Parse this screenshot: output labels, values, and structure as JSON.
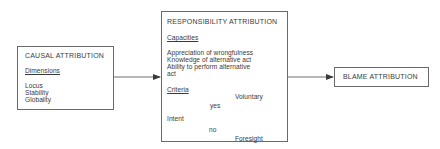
{
  "causal": {
    "title": "CAUSAL ATTRIBUTION",
    "section_label": "Dimensions",
    "items": [
      "Locus",
      "Stability",
      "Globality"
    ]
  },
  "responsibility": {
    "title": "RESPONSIBILITY ATTRIBUTION",
    "capacities_label": "Capacities",
    "capacities": [
      "Appreciation of wrongfulness",
      "Knowledge of alternative act",
      "Ability to perform alternative",
      "act"
    ],
    "criteria_label": "Criteria",
    "intent_label": "Intent",
    "yes_label": "yes",
    "no_label": "no",
    "yes_outcome": "Voluntary",
    "no_outcome": "Foresight"
  },
  "blame": {
    "title": "BLAME ATTRIBUTION"
  },
  "colors": {
    "line": "#4a4a4a",
    "border": "#6a6a6a",
    "text": "#3a3a3a"
  }
}
